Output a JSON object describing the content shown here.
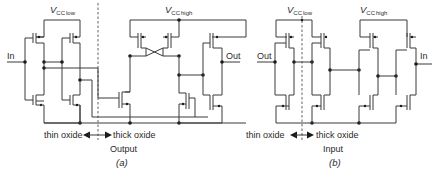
{
  "diagram_a": {
    "vcc_low": {
      "main": "V",
      "sub_cc": "CC",
      "sub_level": "low"
    },
    "vcc_high": {
      "main": "V",
      "sub_cc": "CC",
      "sub_level": "high"
    },
    "input_label": "In",
    "output_label": "Out",
    "thin_oxide": "thin oxide",
    "thick_oxide": "thick oxide",
    "type_label": "Output",
    "caption": "(a)"
  },
  "diagram_b": {
    "vcc_low": {
      "main": "V",
      "sub_cc": "CC",
      "sub_level": "low"
    },
    "vcc_high": {
      "main": "V",
      "sub_cc": "CC",
      "sub_level": "high"
    },
    "input_label": "In",
    "output_label": "Out",
    "thin_oxide": "thin oxide",
    "thick_oxide": "thick oxide",
    "type_label": "Input",
    "caption": "(b)"
  },
  "colors": {
    "wire": "#3a3a3a",
    "text": "#2a2a2a",
    "background": "#ffffff"
  }
}
